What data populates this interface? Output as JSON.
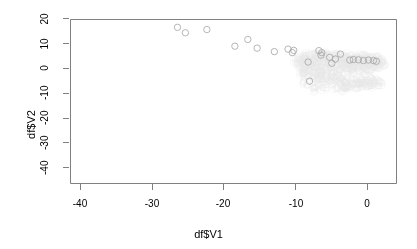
{
  "chart_data": {
    "type": "scatter",
    "title": "",
    "subtitle": "",
    "xlabel": "df$V1",
    "ylabel": "df$V2",
    "xlim": [
      -43.5,
      2.5
    ],
    "ylim": [
      -43.5,
      22.5
    ],
    "xticks": [
      -40,
      -30,
      -20,
      -10,
      0
    ],
    "xtick_labels": [
      "-40",
      "-30",
      "-20",
      "-10",
      "0"
    ],
    "yticks": [
      20,
      10,
      0,
      -10,
      -20,
      -30,
      -40
    ],
    "ytick_labels": [
      "20",
      "10",
      "0",
      "-10",
      "-20",
      "-30",
      "-40"
    ],
    "grid": false,
    "legend": null,
    "annotations": [],
    "marker": "open-circle",
    "marker_radius_px": 3.2,
    "series": [
      {
        "name": "dense-cloud",
        "color": "#e8e8e8",
        "marker": "open-circle",
        "points": [
          [
            -9.8,
            2.8
          ],
          [
            -9.4,
            1.6
          ],
          [
            -9.1,
            3.6
          ],
          [
            -8.9,
            0.9
          ],
          [
            -8.6,
            2.2
          ],
          [
            -8.4,
            4.1
          ],
          [
            -8.2,
            1.1
          ],
          [
            -8.0,
            3.0
          ],
          [
            -7.8,
            -0.2
          ],
          [
            -7.6,
            2.6
          ],
          [
            -7.4,
            4.6
          ],
          [
            -7.2,
            1.8
          ],
          [
            -7.0,
            3.3
          ],
          [
            -6.9,
            0.4
          ],
          [
            -6.7,
            2.1
          ],
          [
            -6.5,
            5.0
          ],
          [
            -6.3,
            3.8
          ],
          [
            -6.1,
            1.3
          ],
          [
            -6.0,
            -0.8
          ],
          [
            -5.8,
            2.9
          ],
          [
            -5.6,
            4.3
          ],
          [
            -5.4,
            1.0
          ],
          [
            -5.2,
            3.1
          ],
          [
            -5.1,
            -1.6
          ],
          [
            -4.9,
            2.4
          ],
          [
            -4.7,
            4.8
          ],
          [
            -4.5,
            0.6
          ],
          [
            -4.3,
            3.4
          ],
          [
            -4.2,
            -2.3
          ],
          [
            -4.0,
            2.0
          ],
          [
            -3.8,
            4.2
          ],
          [
            -3.6,
            1.4
          ],
          [
            -3.5,
            3.6
          ],
          [
            -3.3,
            -0.4
          ],
          [
            -3.1,
            2.7
          ],
          [
            -2.9,
            4.4
          ],
          [
            -2.8,
            0.2
          ],
          [
            -2.6,
            3.0
          ],
          [
            -2.4,
            -1.2
          ],
          [
            -2.2,
            2.3
          ],
          [
            -2.1,
            4.0
          ],
          [
            -1.9,
            1.1
          ],
          [
            -1.7,
            3.3
          ],
          [
            -1.5,
            -0.6
          ],
          [
            -1.4,
            2.6
          ],
          [
            -1.2,
            4.1
          ],
          [
            -1.0,
            0.8
          ],
          [
            -0.8,
            3.0
          ],
          [
            -0.7,
            -1.5
          ],
          [
            -0.5,
            2.2
          ],
          [
            -0.3,
            3.7
          ],
          [
            -0.1,
            1.4
          ],
          [
            0.1,
            3.1
          ],
          [
            0.3,
            -0.3
          ],
          [
            0.5,
            2.5
          ],
          [
            0.7,
            3.9
          ],
          [
            0.9,
            1.2
          ],
          [
            1.1,
            2.9
          ],
          [
            1.3,
            0.4
          ],
          [
            1.5,
            2.3
          ],
          [
            -9.2,
            -1.4
          ],
          [
            -8.8,
            -2.8
          ],
          [
            -8.3,
            -1.9
          ],
          [
            -7.9,
            -3.4
          ],
          [
            -7.5,
            -2.1
          ],
          [
            -7.1,
            -4.0
          ],
          [
            -6.8,
            -2.5
          ],
          [
            -6.4,
            -4.6
          ],
          [
            -6.0,
            -3.0
          ],
          [
            -5.7,
            -5.1
          ],
          [
            -5.3,
            -3.5
          ],
          [
            -5.0,
            -5.6
          ],
          [
            -4.6,
            -4.0
          ],
          [
            -4.2,
            -6.0
          ],
          [
            -3.9,
            -4.4
          ],
          [
            -3.5,
            -6.4
          ],
          [
            -3.2,
            -4.8
          ],
          [
            -2.8,
            -6.8
          ],
          [
            -2.5,
            -5.0
          ],
          [
            -2.1,
            -7.0
          ],
          [
            -1.8,
            -5.3
          ],
          [
            -1.4,
            -7.1
          ],
          [
            -1.1,
            -5.4
          ],
          [
            -0.7,
            -7.0
          ],
          [
            -0.4,
            -5.2
          ],
          [
            0.0,
            -6.6
          ],
          [
            0.3,
            -4.9
          ],
          [
            0.7,
            -6.0
          ],
          [
            1.0,
            -4.4
          ],
          [
            1.4,
            -5.2
          ],
          [
            -8.5,
            0.1
          ],
          [
            -7.7,
            1.4
          ],
          [
            -6.6,
            -0.9
          ],
          [
            -5.5,
            0.3
          ],
          [
            -4.4,
            -1.0
          ],
          [
            -3.4,
            0.5
          ],
          [
            -2.3,
            -0.5
          ],
          [
            -1.3,
            0.9
          ],
          [
            -0.2,
            -0.1
          ],
          [
            0.8,
            0.7
          ],
          [
            -9.0,
            4.4
          ],
          [
            -8.1,
            5.2
          ],
          [
            -7.3,
            5.6
          ],
          [
            -6.2,
            5.8
          ],
          [
            -5.9,
            5.4
          ],
          [
            -4.8,
            5.5
          ],
          [
            -3.7,
            5.0
          ],
          [
            -2.7,
            5.1
          ],
          [
            -1.6,
            4.7
          ],
          [
            -0.6,
            4.6
          ],
          [
            0.4,
            4.4
          ],
          [
            1.2,
            4.0
          ],
          [
            1.7,
            3.2
          ],
          [
            1.9,
            2.4
          ],
          [
            2.0,
            1.6
          ],
          [
            -8.7,
            -6.0
          ],
          [
            -7.2,
            -7.2
          ],
          [
            -5.8,
            -7.8
          ],
          [
            -4.1,
            -8.2
          ],
          [
            -2.6,
            -8.0
          ],
          [
            -1.0,
            -7.6
          ],
          [
            0.5,
            -7.2
          ],
          [
            1.6,
            -6.4
          ],
          [
            -6.9,
            -8.6
          ],
          [
            -3.0,
            -8.8
          ]
        ]
      },
      {
        "name": "highlighted-arc",
        "color": "#a9a9a9",
        "marker": "open-circle",
        "points": [
          [
            -26.4,
            16.4
          ],
          [
            -25.3,
            14.2
          ],
          [
            -22.3,
            15.5
          ],
          [
            -18.4,
            8.8
          ],
          [
            -16.6,
            11.5
          ],
          [
            -15.3,
            8.0
          ],
          [
            -12.9,
            6.6
          ],
          [
            -11.0,
            7.6
          ],
          [
            -10.4,
            6.2
          ],
          [
            -10.2,
            7.1
          ],
          [
            -8.2,
            2.4
          ],
          [
            -8.0,
            -5.3
          ],
          [
            -6.7,
            7.0
          ],
          [
            -6.4,
            5.2
          ],
          [
            -6.3,
            6.2
          ],
          [
            -5.2,
            4.3
          ],
          [
            -4.9,
            1.9
          ],
          [
            -4.4,
            3.6
          ],
          [
            -3.7,
            5.6
          ],
          [
            -2.4,
            3.2
          ],
          [
            -1.9,
            3.4
          ],
          [
            -1.2,
            3.3
          ],
          [
            -0.5,
            3.0
          ],
          [
            0.2,
            3.2
          ],
          [
            0.9,
            3.0
          ],
          [
            1.3,
            2.7
          ]
        ]
      }
    ]
  },
  "axes": {
    "frame": {
      "left": 70,
      "right": 396,
      "top": 19,
      "bottom": 183
    },
    "x_pixel_at_zero": 367,
    "x_pixels_per_unit": 7.18,
    "y_pixel_at_zero": 68,
    "y_pixels_per_unit": 2.48
  },
  "style": {
    "background": "#ffffff",
    "frame_color": "#808080",
    "tick_color": "#808080",
    "text_color": "#000000",
    "cloud_color": "#e8e8e8",
    "point_color": "#a9a9a9"
  }
}
